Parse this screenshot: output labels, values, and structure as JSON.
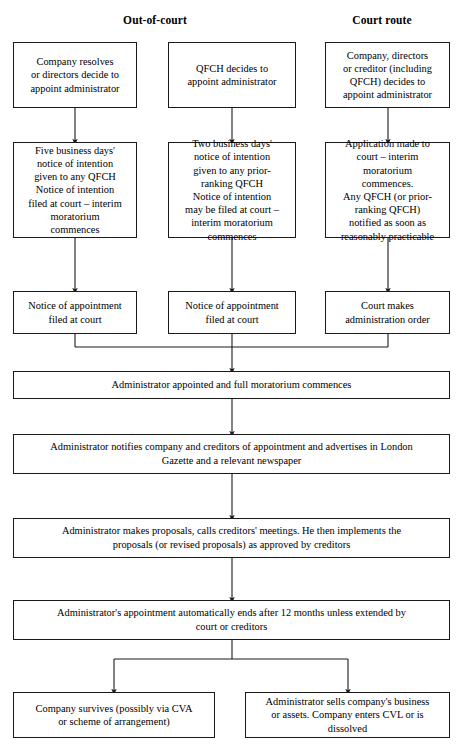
{
  "diagram": {
    "headers": [
      {
        "label": "Out-of-court",
        "x": 155,
        "y": 14
      },
      {
        "label": "Court route",
        "x": 382,
        "y": 14
      }
    ],
    "nodes": [
      {
        "id": "oc1-start",
        "name": "company-resolves-box",
        "text": "Company resolves\nor directors decide to\nappoint administrator",
        "x": 13,
        "y": 42,
        "w": 124,
        "h": 66
      },
      {
        "id": "oc2-start",
        "name": "qfch-decides-box",
        "text": "QFCH decides to\nappoint administrator",
        "x": 168,
        "y": 42,
        "w": 128,
        "h": 66
      },
      {
        "id": "cr-start",
        "name": "company-directors-creditor-box",
        "text": "Company, directors\nor creditor (including\nQFCH) decides to\nappoint administrator",
        "x": 325,
        "y": 42,
        "w": 125,
        "h": 66
      },
      {
        "id": "oc1-notice",
        "name": "five-business-days-notice-box",
        "text": "Five business days'\nnotice of intention\ngiven to any QFCH\nNotice of intention\nfiled at court – interim\nmoratorium\ncommences",
        "x": 13,
        "y": 142,
        "w": 124,
        "h": 96
      },
      {
        "id": "oc2-notice",
        "name": "two-business-days-notice-box",
        "text": "Two business days'\nnotice of intention\ngiven to any prior-\nranking QFCH\nNotice of intention\nmay be filed at court –\ninterim moratorium\ncommences",
        "x": 168,
        "y": 142,
        "w": 128,
        "h": 96
      },
      {
        "id": "cr-application",
        "name": "application-made-to-court-box",
        "text": "Application made to\ncourt – interim\nmoratorium\ncommences.\nAny QFCH (or prior-\nranking QFCH)\nnotified as soon as\nreasonably practicable",
        "x": 325,
        "y": 142,
        "w": 125,
        "h": 96
      },
      {
        "id": "oc1-filed",
        "name": "notice-of-appointment-filed-left-box",
        "text": "Notice of appointment\nfiled at court",
        "x": 13,
        "y": 291,
        "w": 124,
        "h": 43
      },
      {
        "id": "oc2-filed",
        "name": "notice-of-appointment-filed-middle-box",
        "text": "Notice of appointment\nfiled at court",
        "x": 168,
        "y": 291,
        "w": 128,
        "h": 43
      },
      {
        "id": "cr-order",
        "name": "court-makes-administration-order-box",
        "text": "Court makes\nadministration order",
        "x": 325,
        "y": 291,
        "w": 125,
        "h": 43
      },
      {
        "id": "appointed",
        "name": "administrator-appointed-box",
        "text": "Administrator appointed and full moratorium commences",
        "x": 13,
        "y": 371,
        "w": 437,
        "h": 28
      },
      {
        "id": "notifies",
        "name": "administrator-notifies-box",
        "text": "Administrator notifies company and creditors of appointment and advertises in London\nGazette and a relevant newspaper",
        "x": 13,
        "y": 434,
        "w": 437,
        "h": 40
      },
      {
        "id": "proposals",
        "name": "administrator-proposals-box",
        "text": "Administrator makes proposals, calls creditors' meetings. He then implements the\nproposals (or revised proposals) as approved by creditors",
        "x": 13,
        "y": 518,
        "w": 437,
        "h": 40
      },
      {
        "id": "ends",
        "name": "appointment-ends-box",
        "text": "Administrator's appointment automatically ends after 12 months unless extended by\ncourt or creditors",
        "x": 13,
        "y": 600,
        "w": 437,
        "h": 40
      },
      {
        "id": "survives",
        "name": "company-survives-box",
        "text": "Company survives (possibly via CVA\nor scheme of arrangement)",
        "x": 13,
        "y": 692,
        "w": 202,
        "h": 46
      },
      {
        "id": "sells",
        "name": "administrator-sells-box",
        "text": "Administrator sells company's business\nor assets. Company enters CVL or is\ndissolved",
        "x": 245,
        "y": 692,
        "w": 205,
        "h": 46
      }
    ],
    "connectors": {
      "stroke": "#1a1a1a",
      "stroke_width": 1.1,
      "arrows": [
        {
          "name": "arrow-left-start-to-notice",
          "from": [
            75,
            108
          ],
          "to": [
            75,
            142
          ]
        },
        {
          "name": "arrow-middle-start-to-notice",
          "from": [
            232,
            108
          ],
          "to": [
            232,
            142
          ]
        },
        {
          "name": "arrow-right-start-to-application",
          "from": [
            388,
            108
          ],
          "to": [
            388,
            142
          ]
        },
        {
          "name": "arrow-left-notice-to-filed",
          "from": [
            75,
            238
          ],
          "to": [
            75,
            291
          ]
        },
        {
          "name": "arrow-middle-notice-to-filed",
          "from": [
            232,
            238
          ],
          "to": [
            232,
            291
          ]
        },
        {
          "name": "arrow-right-application-to-order",
          "from": [
            388,
            238
          ],
          "to": [
            388,
            291
          ]
        },
        {
          "name": "arrow-merge-to-appointed",
          "from": [
            232,
            347
          ],
          "to": [
            232,
            371
          ]
        },
        {
          "name": "arrow-appointed-to-notifies",
          "from": [
            232,
            399
          ],
          "to": [
            232,
            434
          ]
        },
        {
          "name": "arrow-notifies-to-proposals",
          "from": [
            232,
            474
          ],
          "to": [
            232,
            518
          ]
        },
        {
          "name": "arrow-proposals-to-ends",
          "from": [
            232,
            558
          ],
          "to": [
            232,
            600
          ]
        },
        {
          "name": "arrow-branch-to-survives",
          "from": [
            114,
            659
          ],
          "to": [
            114,
            692
          ]
        },
        {
          "name": "arrow-branch-to-sells",
          "from": [
            348,
            659
          ],
          "to": [
            348,
            692
          ]
        }
      ],
      "merge_bus": {
        "name": "merge-bus-three-columns",
        "y": 347,
        "x_left": 75,
        "x_right": 388,
        "drops_from_y": 334,
        "center_x": 232
      },
      "split_bus": {
        "name": "split-bus-two-outcomes",
        "y": 659,
        "x_left": 114,
        "x_right": 348,
        "stem_from_y": 640,
        "center_x": 232
      }
    }
  }
}
